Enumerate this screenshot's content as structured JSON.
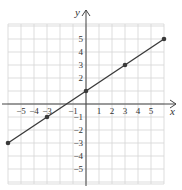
{
  "chart_data": {
    "type": "line",
    "title": "",
    "xlabel": "x",
    "ylabel": "y",
    "xlim": [
      -6,
      6
    ],
    "ylim": [
      -6,
      6
    ],
    "grid": true,
    "x_ticks": [
      -5,
      -4,
      -3,
      -1,
      1,
      2,
      3,
      4,
      5
    ],
    "y_ticks": [
      5,
      4,
      3,
      2,
      -1,
      -2,
      -3,
      -4,
      -5
    ],
    "x_tick_labels": [
      "−5",
      "−4",
      "−3",
      "−1",
      "1",
      "2",
      "3",
      "4",
      "5"
    ],
    "y_tick_labels": [
      "5",
      "4",
      "3",
      "2",
      "−1",
      "−2",
      "−3",
      "−4",
      "−5"
    ],
    "series": [
      {
        "name": "line",
        "x": [
          -6,
          -3,
          0,
          3,
          6
        ],
        "y": [
          -3,
          -1,
          1,
          3,
          5
        ],
        "markers": true
      }
    ],
    "colors": {
      "line": "#3a3a3a",
      "grid": "#d4d4d4",
      "axis": "#444444"
    }
  }
}
